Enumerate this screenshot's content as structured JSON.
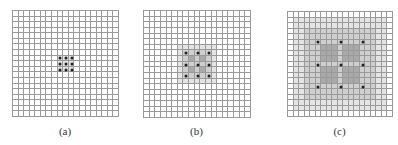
{
  "figure": {
    "grid_size": 19,
    "colors": {
      "line": "#9a9a9a",
      "light": "#e4e4e4",
      "medium": "#cfcfcf",
      "dark": "#a9a9a9",
      "dot": "#222222"
    },
    "panels": [
      {
        "id": "a",
        "label": "(a)",
        "left": 12,
        "top": 10,
        "size": 106,
        "dot_spacing": 1,
        "dots": [
          [
            8,
            8
          ],
          [
            8,
            9
          ],
          [
            8,
            10
          ],
          [
            9,
            8
          ],
          [
            9,
            9
          ],
          [
            9,
            10
          ],
          [
            10,
            8
          ],
          [
            10,
            9
          ],
          [
            10,
            10
          ]
        ],
        "shading": [
          {
            "r0": 8,
            "r1": 10,
            "c0": 8,
            "c1": 10,
            "level": "light"
          }
        ]
      },
      {
        "id": "b",
        "label": "(b)",
        "left": 143,
        "top": 10,
        "size": 107,
        "dot_spacing": 2,
        "dots": [
          [
            7,
            7
          ],
          [
            7,
            9
          ],
          [
            7,
            11
          ],
          [
            9,
            7
          ],
          [
            9,
            9
          ],
          [
            9,
            11
          ],
          [
            11,
            7
          ],
          [
            11,
            9
          ],
          [
            11,
            11
          ]
        ],
        "shading": [
          {
            "r0": 6,
            "r1": 12,
            "c0": 6,
            "c1": 12,
            "level": "light"
          },
          {
            "r0": 7,
            "r1": 11,
            "c0": 7,
            "c1": 11,
            "level": "medium"
          },
          {
            "r0": 8,
            "r1": 8,
            "c0": 8,
            "c1": 8,
            "level": "dark"
          },
          {
            "r0": 8,
            "r1": 8,
            "c0": 10,
            "c1": 10,
            "level": "dark"
          },
          {
            "r0": 10,
            "r1": 10,
            "c0": 8,
            "c1": 8,
            "level": "dark"
          },
          {
            "r0": 10,
            "r1": 10,
            "c0": 10,
            "c1": 10,
            "level": "dark"
          }
        ]
      },
      {
        "id": "c",
        "label": "(c)",
        "left": 287,
        "top": 11,
        "size": 105,
        "dot_spacing": 4,
        "dots": [
          [
            5,
            5
          ],
          [
            5,
            9
          ],
          [
            5,
            13
          ],
          [
            9,
            5
          ],
          [
            9,
            9
          ],
          [
            9,
            13
          ],
          [
            13,
            5
          ],
          [
            13,
            9
          ],
          [
            13,
            13
          ]
        ],
        "shading": [
          {
            "r0": 1,
            "r1": 17,
            "c0": 1,
            "c1": 17,
            "level": "light"
          },
          {
            "r0": 3,
            "r1": 15,
            "c0": 3,
            "c1": 15,
            "level": "medium"
          },
          {
            "r0": 6,
            "r1": 8,
            "c0": 6,
            "c1": 8,
            "level": "dark"
          },
          {
            "r0": 6,
            "r1": 8,
            "c0": 10,
            "c1": 12,
            "level": "dark"
          },
          {
            "r0": 10,
            "r1": 12,
            "c0": 6,
            "c1": 8,
            "level": "dark"
          },
          {
            "r0": 10,
            "r1": 12,
            "c0": 10,
            "c1": 12,
            "level": "dark"
          }
        ]
      }
    ]
  }
}
